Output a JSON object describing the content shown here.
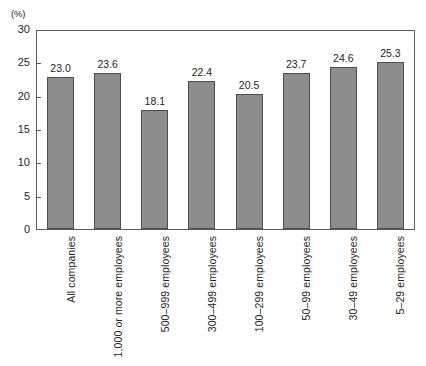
{
  "chart_data": {
    "type": "bar",
    "title": "",
    "subtitle": "",
    "xlabel": "",
    "ylabel": "",
    "unit_label": "(%)",
    "ylim": [
      0,
      30
    ],
    "yticks": [
      0,
      5,
      10,
      15,
      20,
      25,
      30
    ],
    "ytick_labels": [
      "0",
      "5",
      "10",
      "15",
      "20",
      "25",
      "30"
    ],
    "grid": false,
    "legend": false,
    "legend_position": "none",
    "categories": [
      "All companies",
      "1,000 or more employees",
      "500–999 employees",
      "300–499 employees",
      "100–299 employees",
      "50–99 employees",
      "30–49 employees",
      "5–29 employees"
    ],
    "values": [
      23.0,
      23.6,
      18.1,
      22.4,
      20.5,
      23.7,
      24.6,
      25.3
    ],
    "value_labels": [
      "23.0",
      "23.6",
      "18.1",
      "22.4",
      "20.5",
      "23.7",
      "24.6",
      "25.3"
    ],
    "bar_color": "#8d8d8d",
    "bar_edge_color": "#4d4d4d",
    "axis_color": "#5a5a5a",
    "text_color": "#231f20"
  }
}
